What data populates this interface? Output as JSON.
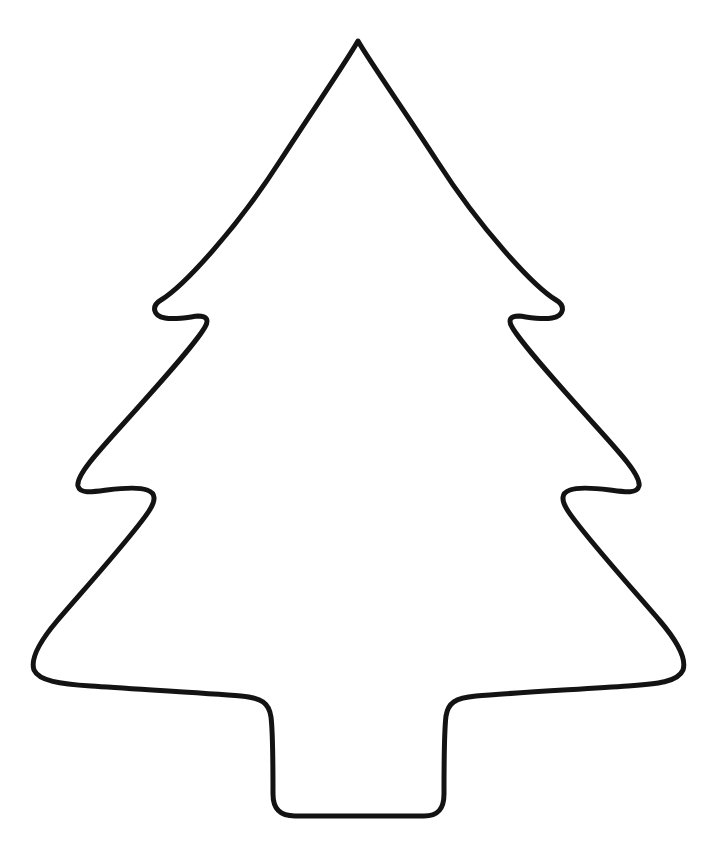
{
  "document": {
    "kind": "line-art-drawing",
    "subject": "christmas-tree-outline",
    "title": "Christmas Tree Outline",
    "background_color": "#ffffff",
    "stroke_color": "#131313",
    "fill_color": "#ffffff",
    "stroke_width": 5,
    "canvas": {
      "width": 725,
      "height": 857
    },
    "text_content": "",
    "annotations": []
  },
  "shape": {
    "name": "christmas-tree-silhouette",
    "description": "Closed outline of a stylized three-tier christmas tree with a rectangular trunk, drawn as a single black contour on a white background",
    "tiers": 3,
    "has_trunk": true,
    "symmetry_axis_x": 358,
    "apex": {
      "x": 358,
      "y": 40
    },
    "bounds": {
      "left": 32,
      "top": 40,
      "right": 684,
      "bottom": 820
    },
    "notches": [
      {
        "name": "upper-left-notch",
        "x": 178,
        "y": 312
      },
      {
        "name": "upper-right-notch",
        "x": 538,
        "y": 312
      },
      {
        "name": "middle-left-notch",
        "x": 112,
        "y": 498
      },
      {
        "name": "middle-right-notch",
        "x": 604,
        "y": 498
      }
    ],
    "widest_points": [
      {
        "name": "bottom-left-extent",
        "x": 32,
        "y": 672
      },
      {
        "name": "bottom-right-extent",
        "x": 684,
        "y": 670
      }
    ],
    "trunk": {
      "left": 272,
      "right": 443,
      "top": 700,
      "bottom": 818
    },
    "path": "M 358 41 C 370 62 404 110 437 161 C 480 228 533 286 556 300 C 566 306 564 316 552 318 C 541 320 528 317 519 316 C 510 316 508 320 512 327 C 521 343 556 382 593 423 C 622 455 641 476 639 486 C 637 494 625 492 610 490 C 594 488 578 487 570 490 C 561 493 561 500 568 511 C 583 534 630 586 660 621 C 682 647 686 661 683 670 C 678 682 657 684 628 686 C 585 689 510 693 476 696 C 455 698 448 703 446 716 C 444 732 444 779 444 794 C 444 809 438 816 424 816 C 400 816 318 816 295 816 C 280 816 273 809 273 794 C 273 778 273 733 271 717 C 269 703 262 698 241 696 C 207 693 133 689 91 686 C 60 684 39 681 34 670 C 31 661 35 647 57 621 C 87 586 134 534 149 511 C 156 500 156 493 147 490 C 139 487 123 488 107 490 C 92 492 80 494 78 486 C 76 476 95 455 124 423 C 161 382 196 343 205 327 C 209 320 207 316 198 316 C 189 317 176 320 165 318 C 153 316 151 306 161 300 C 184 286 237 228 280 161 C 313 110 346 62 358 41 Z"
  }
}
